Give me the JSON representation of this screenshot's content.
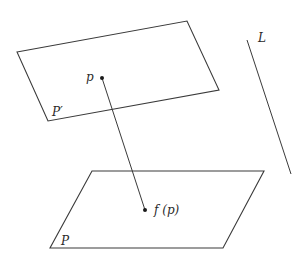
{
  "diagram": {
    "stroke_color": "#3a3a3a",
    "background": "#ffffff",
    "planes": [
      {
        "id": "plane-p-prime",
        "label": "P′",
        "vertices": [
          [
            17,
            52
          ],
          [
            187,
            21
          ],
          [
            219,
            90
          ],
          [
            48,
            121
          ]
        ],
        "label_pos": [
          52,
          116
        ]
      },
      {
        "id": "plane-p",
        "label": "P",
        "vertices": [
          [
            92,
            171
          ],
          [
            264,
            171
          ],
          [
            223,
            248
          ],
          [
            50,
            248
          ]
        ],
        "label_pos": [
          61,
          245
        ]
      }
    ],
    "points": [
      {
        "id": "point-p",
        "label": "p",
        "pos": [
          102,
          78
        ],
        "label_pos": [
          86,
          81
        ]
      },
      {
        "id": "point-fp",
        "label": "f (p)",
        "pos": [
          145,
          210
        ],
        "label_pos": [
          154,
          214
        ]
      }
    ],
    "segments": [
      {
        "id": "mapping-segment",
        "from": [
          102,
          78
        ],
        "to": [
          145,
          210
        ]
      }
    ],
    "lines": [
      {
        "id": "line-l",
        "label": "L",
        "from": [
          247,
          40
        ],
        "to": [
          291,
          174
        ],
        "label_pos": [
          258,
          42
        ]
      }
    ]
  }
}
